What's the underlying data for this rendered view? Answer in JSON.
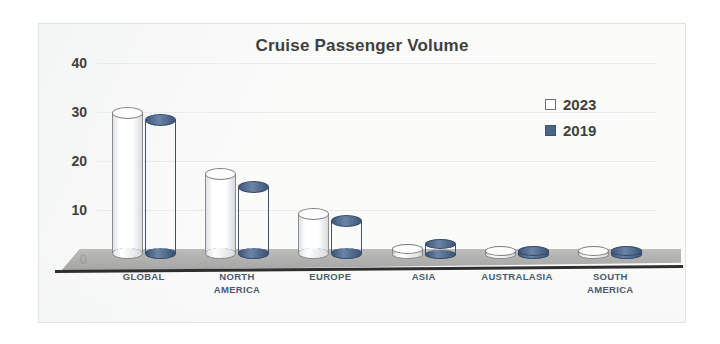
{
  "chart_data": {
    "type": "bar",
    "title": "Cruise Passenger Volume",
    "xlabel": "",
    "ylabel": "",
    "ylim": [
      0,
      40
    ],
    "yticks": [
      0,
      10,
      20,
      30,
      40
    ],
    "grid": true,
    "legend_position": "right",
    "style": "3d-cylinder-clustered",
    "categories": [
      "GLOBAL",
      "NORTH AMERICA",
      "EUROPE",
      "ASIA",
      "AUSTRALASIA",
      "SOUTH AMERICA"
    ],
    "series": [
      {
        "name": "2023",
        "color": "#ffffff",
        "values": [
          31,
          18.5,
          10.5,
          3,
          2,
          2
        ]
      },
      {
        "name": "2019",
        "color": "#4a6585",
        "values": [
          29.5,
          16,
          9,
          4,
          2,
          2
        ]
      }
    ]
  },
  "legend": {
    "items": [
      {
        "label": "2023",
        "swatch": "white"
      },
      {
        "label": "2019",
        "swatch": "blue"
      }
    ]
  },
  "axis": {
    "ytick_labels": [
      "40",
      "30",
      "20",
      "10",
      "0"
    ]
  },
  "colors": {
    "series_2019": "#4a6585",
    "series_2023": "#ffffff",
    "axis_line": "#2e2e2e",
    "floor": "#a8a8a6",
    "gridline": "#e9ebee",
    "title_text": "#3f3f3f",
    "category_text": "#4b5a6e",
    "frame_border": "#e3e3e1",
    "plot_background": "#fbfbfa"
  }
}
